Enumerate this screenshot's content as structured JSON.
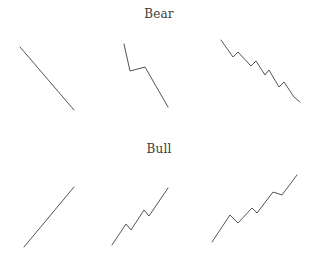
{
  "figure": {
    "colors": {
      "background": "#ffffff",
      "line": "#555555",
      "text": "#3b3b3b"
    },
    "bear": {
      "title": "Bear",
      "panels": [
        {
          "id": "bear-straight-decline",
          "points": "20,47 74,110"
        },
        {
          "id": "bear-decline-single-rally",
          "points": "124,44 130,71 145,67 168,107"
        },
        {
          "id": "bear-decline-multi-rally",
          "points": "221,40 233,57 238,52 251,66 256,61 265,75 269,70 279,87 284,82 294,97 300,102"
        }
      ]
    },
    "bull": {
      "title": "Bull",
      "panels": [
        {
          "id": "bull-straight-advance",
          "points": "24,247 74,187"
        },
        {
          "id": "bull-advance-double-dip",
          "points": "112,245 126,224 131,230 144,210 149,216 168,188"
        },
        {
          "id": "bull-advance-multi-dip",
          "points": "212,242 230,215 238,223 252,208 257,213 273,192 282,195 297,175"
        }
      ]
    }
  }
}
